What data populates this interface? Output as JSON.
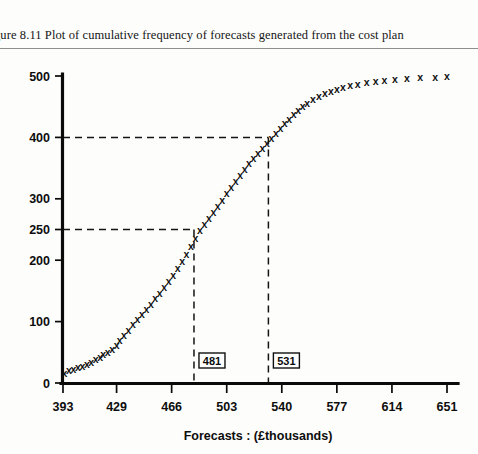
{
  "caption": {
    "text": "gure 8.11  Plot of cumulative frequency of forecasts generated from the cost plan"
  },
  "chart_data": {
    "type": "scatter",
    "title": "Plot of cumulative frequency of forecasts generated from the cost plan",
    "xlabel": "Forecasts : (£thousands)",
    "ylabel": "",
    "marker": "x",
    "grid": false,
    "legend": null,
    "xlim": [
      393,
      651
    ],
    "ylim": [
      0,
      500
    ],
    "xticks": [
      393,
      429,
      466,
      503,
      540,
      577,
      614,
      651
    ],
    "yticks": [
      0,
      100,
      200,
      250,
      300,
      400,
      500
    ],
    "x": [
      394,
      397,
      400,
      403,
      406,
      409,
      412,
      415,
      418,
      420,
      423,
      426,
      429,
      431,
      434,
      437,
      440,
      443,
      446,
      449,
      452,
      455,
      458,
      461,
      464,
      467,
      470,
      473,
      476,
      479,
      482,
      485,
      488,
      491,
      494,
      497,
      500,
      503,
      506,
      509,
      512,
      515,
      518,
      521,
      524,
      527,
      530,
      533,
      536,
      539,
      542,
      545,
      548,
      551,
      554,
      557,
      561,
      565,
      569,
      573,
      577,
      581,
      586,
      591,
      597,
      603,
      609,
      616,
      624,
      633,
      643,
      651
    ],
    "y": [
      15,
      20,
      22,
      25,
      27,
      30,
      33,
      38,
      42,
      46,
      50,
      55,
      62,
      70,
      78,
      86,
      95,
      103,
      112,
      120,
      128,
      137,
      146,
      155,
      165,
      175,
      186,
      198,
      210,
      222,
      235,
      248,
      258,
      268,
      278,
      288,
      298,
      308,
      318,
      328,
      338,
      348,
      358,
      366,
      374,
      382,
      390,
      398,
      406,
      414,
      422,
      430,
      437,
      444,
      450,
      456,
      462,
      467,
      471,
      475,
      478,
      481,
      484,
      487,
      489,
      491,
      493,
      494,
      496,
      497,
      498,
      499
    ],
    "annotations": [
      {
        "label": "481",
        "x": 481,
        "y": 250,
        "guide": "both"
      },
      {
        "label": "531",
        "x": 531,
        "y": 400,
        "guide": "both"
      }
    ]
  }
}
